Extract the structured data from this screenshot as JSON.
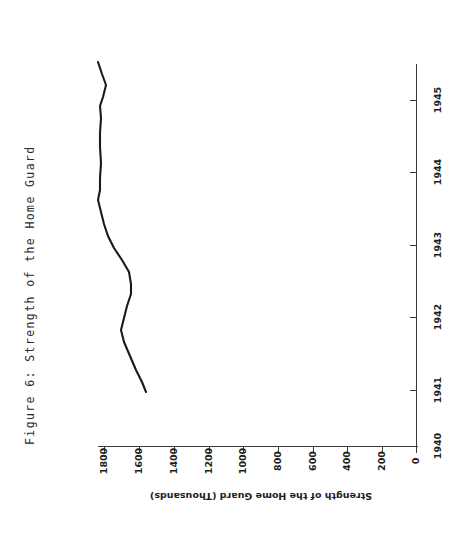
{
  "figure": {
    "caption": "Figure 6:  Strength of the Home Guard"
  },
  "chart_data": {
    "type": "line",
    "title": "Figure 6: Strength of the Home Guard",
    "orientation": "rotated-90-ccw",
    "xlabel": "",
    "ylabel": "Strength of the Home Guard (Thousands)",
    "categories": [
      "1940",
      "1941",
      "1942",
      "1943",
      "1944",
      "1945"
    ],
    "category_axis_ticks": [
      "1940",
      "1941",
      "1942",
      "1943",
      "1944",
      "1945"
    ],
    "value_axis_ticks": [
      "1800",
      "1600",
      "1400",
      "1200",
      "1000",
      "800",
      "600",
      "400",
      "200",
      "0"
    ],
    "xlim": [
      1940.0,
      1945.6
    ],
    "ylim": [
      0,
      1900
    ],
    "grid": false,
    "legend": null,
    "series": [
      {
        "name": "Strength of the Home Guard (Thousands)",
        "x": [
          1940.55,
          1941.0,
          1941.45,
          1941.8,
          1942.05,
          1942.45,
          1942.8,
          1943.1,
          1943.4,
          1943.75,
          1944.1,
          1944.45,
          1944.8,
          1945.05,
          1945.3
        ],
        "values": [
          1430,
          1520,
          1615,
          1600,
          1575,
          1590,
          1640,
          1680,
          1755,
          1790,
          1775,
          1795,
          1800,
          1760,
          1715
        ]
      }
    ],
    "annotations": []
  },
  "axis_titles": {
    "value_axis": "Strength of the Home Guard (Thousands)"
  },
  "ticks": {
    "value": [
      {
        "label": "1800",
        "x": 104
      },
      {
        "label": "1600",
        "x": 139
      },
      {
        "label": "1400",
        "x": 174
      },
      {
        "label": "1200",
        "x": 209
      },
      {
        "label": "1000",
        "x": 243
      },
      {
        "label": "800",
        "x": 278
      },
      {
        "label": "600",
        "x": 313
      },
      {
        "label": "400",
        "x": 347
      },
      {
        "label": "200",
        "x": 382
      },
      {
        "label": "0",
        "x": 416
      }
    ],
    "category": [
      {
        "label": "1945",
        "y": 100
      },
      {
        "label": "1944",
        "y": 172
      },
      {
        "label": "1943",
        "y": 245
      },
      {
        "label": "1942",
        "y": 317
      },
      {
        "label": "1941",
        "y": 390
      },
      {
        "label": "1940",
        "y": 446
      }
    ]
  },
  "colors": {
    "line": "#1a1a1a",
    "axis": "#3a3a3a",
    "text": "#1d1d1d",
    "background": "#ffffff"
  },
  "series_path": "M 98,62 L 102,74 L 106,85 L 103,97 L 100,106 L 101,118 L 100,133 L 100,147 L 101,163 L 100,178 L 100,190 L 98,200 L 101,212 L 104,224 L 108,236 L 114,248 L 122,260 L 129,272 L 131,284 L 131,294 L 127,306 L 124,318 L 121,330 L 124,342 L 130,356 L 136,370 L 142,382 L 146,392"
}
